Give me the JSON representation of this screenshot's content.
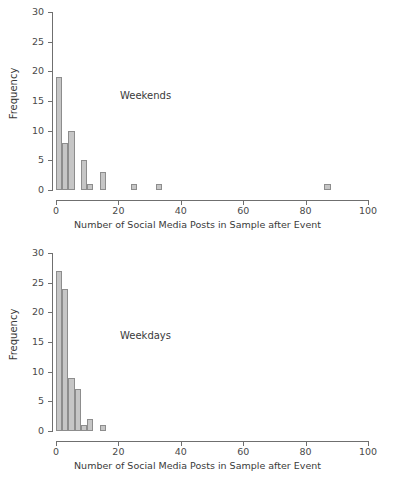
{
  "chart_data": [
    {
      "type": "bar",
      "title": "Weekends",
      "xlabel": "Number of Social Media Posts in Sample after Event",
      "ylabel": "Frequency",
      "xlim": [
        0,
        100
      ],
      "ylim": [
        0,
        30
      ],
      "xticks": [
        0,
        20,
        40,
        60,
        80,
        100
      ],
      "yticks": [
        0,
        5,
        10,
        15,
        20,
        25,
        30
      ],
      "grid": false,
      "legend": "none",
      "bin_width": 2,
      "bins": [
        {
          "x0": 0,
          "x1": 2,
          "value": 19
        },
        {
          "x0": 2,
          "x1": 4,
          "value": 8
        },
        {
          "x0": 4,
          "x1": 6,
          "value": 10
        },
        {
          "x0": 8,
          "x1": 10,
          "value": 5
        },
        {
          "x0": 10,
          "x1": 12,
          "value": 1
        },
        {
          "x0": 14,
          "x1": 16,
          "value": 3
        },
        {
          "x0": 24,
          "x1": 26,
          "value": 1
        },
        {
          "x0": 32,
          "x1": 34,
          "value": 1
        },
        {
          "x0": 86,
          "x1": 88,
          "value": 1
        }
      ]
    },
    {
      "type": "bar",
      "title": "Weekdays",
      "xlabel": "Number of Social Media Posts in Sample after Event",
      "ylabel": "Frequency",
      "xlim": [
        0,
        100
      ],
      "ylim": [
        0,
        30
      ],
      "xticks": [
        0,
        20,
        40,
        60,
        80,
        100
      ],
      "yticks": [
        0,
        5,
        10,
        15,
        20,
        25,
        30
      ],
      "grid": false,
      "legend": "none",
      "bin_width": 2,
      "bins": [
        {
          "x0": 0,
          "x1": 2,
          "value": 27
        },
        {
          "x0": 2,
          "x1": 4,
          "value": 24
        },
        {
          "x0": 4,
          "x1": 6,
          "value": 9
        },
        {
          "x0": 6,
          "x1": 8,
          "value": 7
        },
        {
          "x0": 8,
          "x1": 10,
          "value": 1
        },
        {
          "x0": 10,
          "x1": 12,
          "value": 2
        },
        {
          "x0": 14,
          "x1": 16,
          "value": 1
        }
      ]
    }
  ],
  "style": {
    "bar_fill": "#c6c6c6",
    "bar_stroke": "#8d8d8d",
    "axis_color": "#6f6f6f",
    "text_color": "#3a3a3a",
    "background": "#ffffff"
  }
}
